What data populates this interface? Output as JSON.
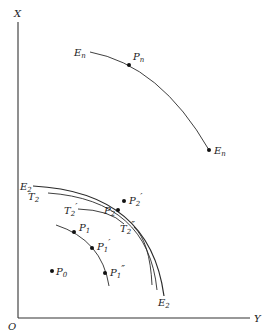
{
  "diagram": {
    "axes": {
      "vertical_label": "X",
      "horizontal_label": "Y",
      "origin_label": "O"
    },
    "curves": {
      "En": {
        "start_label": "E",
        "start_sub": "n",
        "end_label": "E",
        "end_sub": "n"
      },
      "E2": {
        "start_label": "E",
        "start_sub": "2",
        "end_label": "E",
        "end_sub": "2"
      },
      "T2": {
        "label": "T",
        "sub": "2"
      },
      "T2_prime": {
        "label": "T",
        "sub": "2",
        "mark": "′"
      },
      "T2_dprime": {
        "label": "T",
        "sub": "2",
        "mark": "″"
      }
    },
    "points": {
      "Pn": {
        "label": "P",
        "sub": "n",
        "mark": ""
      },
      "P2_prime": {
        "label": "P",
        "sub": "2",
        "mark": "′"
      },
      "P2": {
        "label": "P",
        "sub": "2",
        "mark": ""
      },
      "P1": {
        "label": "P",
        "sub": "1",
        "mark": ""
      },
      "P1_prime": {
        "label": "P",
        "sub": "1",
        "mark": "′"
      },
      "P1_dprime": {
        "label": "P",
        "sub": "1",
        "mark": "″"
      },
      "P0": {
        "label": "P",
        "sub": "0",
        "mark": ""
      }
    },
    "colors": {
      "ink": "#2a2a2a",
      "background": "#ffffff"
    }
  }
}
